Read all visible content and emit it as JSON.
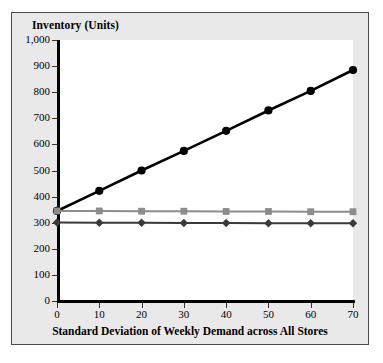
{
  "chart_data": {
    "type": "line",
    "title": "",
    "ylabel": "Inventory (Units)",
    "xlabel": "Standard Deviation of Weekly Demand across All Stores",
    "xlim": [
      0,
      70
    ],
    "ylim": [
      0,
      1000
    ],
    "xticks": [
      "0",
      "10",
      "20",
      "30",
      "40",
      "50",
      "60",
      "70"
    ],
    "xtick_values": [
      0,
      10,
      20,
      30,
      40,
      50,
      60,
      70
    ],
    "yticks": [
      "0",
      "100",
      "200",
      "300",
      "400",
      "500",
      "600",
      "700",
      "800",
      "900",
      "1,000"
    ],
    "ytick_values": [
      0,
      100,
      200,
      300,
      400,
      500,
      600,
      700,
      800,
      900,
      1000
    ],
    "grid": false,
    "legend": "none",
    "x": [
      0,
      10,
      20,
      30,
      40,
      50,
      60,
      70
    ],
    "series": [
      {
        "name": "series-rising",
        "marker": "circle",
        "color": "#000000",
        "values": [
          345,
          422,
          500,
          575,
          652,
          730,
          805,
          885
        ]
      },
      {
        "name": "series-flat-upper",
        "marker": "square",
        "color": "#8c8c8c",
        "values": [
          345,
          345,
          344,
          344,
          343,
          343,
          342,
          342
        ]
      },
      {
        "name": "series-flat-lower",
        "marker": "diamond",
        "color": "#3a3a3a",
        "values": [
          301,
          300,
          300,
          299,
          299,
          298,
          298,
          298
        ]
      }
    ]
  },
  "colors": {
    "panel_background": "#e9e9e9",
    "plot_background": "#ffffff",
    "border": "#4a4a4a",
    "axis": "#000000"
  }
}
